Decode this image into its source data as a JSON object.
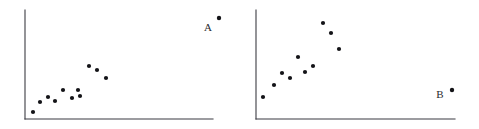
{
  "figure": {
    "background_color": "#ffffff",
    "axis_color": "#3b3b42",
    "marker_color": "#131317",
    "label_color": "#2b2b30",
    "width": 479,
    "height": 129
  },
  "chart_data": [
    {
      "type": "scatter",
      "title": "",
      "xlabel": "",
      "ylabel": "",
      "grid": false,
      "legend": "none",
      "axes": {
        "origin_x": 25,
        "origin_y": 119,
        "y_axis_top": 10,
        "x_axis_right": 213
      },
      "annotations": [
        {
          "text": "A",
          "label_x": 208,
          "label_y": 31,
          "point_x": 219,
          "point_y": 18,
          "role": "outlier-marker"
        }
      ],
      "points": [
        {
          "x": 33,
          "y": 112
        },
        {
          "x": 40,
          "y": 102
        },
        {
          "x": 48,
          "y": 97
        },
        {
          "x": 55,
          "y": 101
        },
        {
          "x": 63,
          "y": 90
        },
        {
          "x": 72,
          "y": 98
        },
        {
          "x": 80,
          "y": 96
        },
        {
          "x": 78,
          "y": 90
        },
        {
          "x": 89,
          "y": 66
        },
        {
          "x": 97,
          "y": 70
        },
        {
          "x": 106,
          "y": 78
        }
      ]
    },
    {
      "type": "scatter",
      "title": "",
      "xlabel": "",
      "ylabel": "",
      "grid": false,
      "legend": "none",
      "axes": {
        "origin_x": 256,
        "origin_y": 119,
        "y_axis_top": 10,
        "x_axis_right": 455
      },
      "annotations": [
        {
          "text": "B",
          "label_x": 440,
          "label_y": 98,
          "point_x": 452,
          "point_y": 90,
          "role": "outlier-marker"
        }
      ],
      "points": [
        {
          "x": 263,
          "y": 97
        },
        {
          "x": 274,
          "y": 85
        },
        {
          "x": 282,
          "y": 73
        },
        {
          "x": 290,
          "y": 78
        },
        {
          "x": 298,
          "y": 57
        },
        {
          "x": 305,
          "y": 72
        },
        {
          "x": 313,
          "y": 66
        },
        {
          "x": 323,
          "y": 23
        },
        {
          "x": 331,
          "y": 33
        },
        {
          "x": 339,
          "y": 49
        }
      ]
    }
  ],
  "markers": {
    "radius": 2.1,
    "outlier_radius": 2.2
  }
}
